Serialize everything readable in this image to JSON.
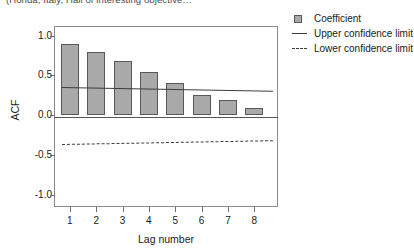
{
  "caption_fragment": "(Honda, Italy, Hall of interesting objective…",
  "axis": {
    "y_title": "ACF",
    "x_title": "Lag number",
    "y_ticks": [
      "1.0",
      "0.5",
      "0.0",
      "-0.5",
      "-1.0"
    ],
    "x_ticks": [
      "1",
      "2",
      "3",
      "4",
      "5",
      "6",
      "7",
      "8"
    ]
  },
  "legend": {
    "items": [
      {
        "label": "Coefficient",
        "key": "bar-swatch",
        "color": "#a9a9a9"
      },
      {
        "label": "Upper confidence limit",
        "key": "solid-line",
        "color": "#3d3d3d"
      },
      {
        "label": "Lower confidence limit",
        "key": "dashed-line",
        "color": "#3d3d3d"
      }
    ]
  },
  "chart_data": {
    "type": "bar",
    "title": "",
    "xlabel": "Lag number",
    "ylabel": "ACF",
    "categories": [
      "1",
      "2",
      "3",
      "4",
      "5",
      "6",
      "7",
      "8"
    ],
    "values": [
      0.9,
      0.79,
      0.68,
      0.54,
      0.4,
      0.25,
      0.19,
      0.09
    ],
    "series": [
      {
        "name": "Coefficient",
        "type": "bar",
        "values": [
          0.9,
          0.79,
          0.68,
          0.54,
          0.4,
          0.25,
          0.19,
          0.09
        ]
      },
      {
        "name": "Upper confidence limit",
        "type": "line",
        "style": "solid",
        "values": [
          0.355,
          0.348,
          0.341,
          0.334,
          0.328,
          0.321,
          0.314,
          0.307
        ]
      },
      {
        "name": "Lower confidence limit",
        "type": "line",
        "style": "dashed",
        "values": [
          -0.355,
          -0.348,
          -0.341,
          -0.334,
          -0.328,
          -0.321,
          -0.314,
          -0.307
        ]
      }
    ],
    "ylim": [
      -1.15,
      1.12
    ],
    "yticks": [
      1.0,
      0.5,
      0.0,
      -0.5,
      -1.0
    ],
    "xlim": [
      0.4,
      8.9
    ],
    "grid": false,
    "legend_position": "right",
    "zero_line": true
  }
}
